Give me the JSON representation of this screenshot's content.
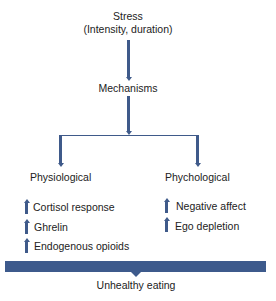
{
  "diagram": {
    "top": {
      "title": "Stress",
      "subtitle": "(Intensity, duration)"
    },
    "middle": {
      "label": "Mechanisms"
    },
    "branches": [
      {
        "label": "Physiological",
        "items": [
          {
            "icon": "up-arrow-icon",
            "label": "Cortisol response"
          },
          {
            "icon": "up-arrow-icon",
            "label": "Ghrelin"
          },
          {
            "icon": "up-arrow-icon",
            "label": "Endogenous opioids"
          }
        ]
      },
      {
        "label": "Phychological",
        "items": [
          {
            "icon": "up-arrow-icon",
            "label": "Negative affect"
          },
          {
            "icon": "up-arrow-icon",
            "label": "Ego depletion"
          }
        ]
      }
    ],
    "outcome": {
      "label": "Unhealthy eating"
    },
    "colors": {
      "arrow": "#3f5a8a",
      "bar": "#3d5a8c",
      "text": "#222222"
    }
  }
}
